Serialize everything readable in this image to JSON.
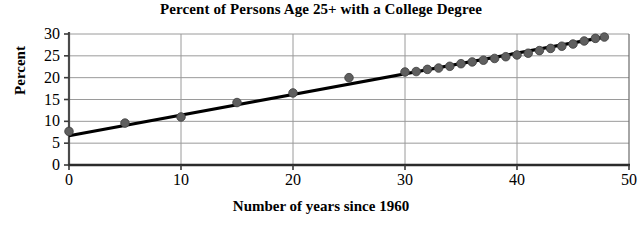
{
  "chart_data": {
    "type": "scatter",
    "title": "Percent of Persons Age 25+ with a College Degree",
    "xlabel": "Number of years since 1960",
    "ylabel": "Percent",
    "xlim": [
      0,
      50
    ],
    "ylim": [
      0,
      30
    ],
    "xticks": [
      0,
      10,
      20,
      30,
      40,
      50
    ],
    "yticks": [
      0,
      5,
      10,
      15,
      20,
      25,
      30
    ],
    "grid": "horizontal-and-vertical",
    "legend": "none",
    "marker_color": "#5f5f5f",
    "line_color": "#000000",
    "series": [
      {
        "name": "Percent with college degree",
        "marker": "circle",
        "points": [
          {
            "x": 0,
            "y": 7.7
          },
          {
            "x": 5,
            "y": 9.6
          },
          {
            "x": 10,
            "y": 11.0
          },
          {
            "x": 15,
            "y": 14.3
          },
          {
            "x": 20,
            "y": 16.5
          },
          {
            "x": 25,
            "y": 20.0
          },
          {
            "x": 30,
            "y": 21.3
          },
          {
            "x": 31,
            "y": 21.4
          },
          {
            "x": 32,
            "y": 21.9
          },
          {
            "x": 33,
            "y": 22.2
          },
          {
            "x": 34,
            "y": 22.6
          },
          {
            "x": 35,
            "y": 23.2
          },
          {
            "x": 36,
            "y": 23.6
          },
          {
            "x": 37,
            "y": 24.0
          },
          {
            "x": 38,
            "y": 24.4
          },
          {
            "x": 39,
            "y": 24.8
          },
          {
            "x": 40,
            "y": 25.2
          },
          {
            "x": 41,
            "y": 25.6
          },
          {
            "x": 42,
            "y": 26.2
          },
          {
            "x": 43,
            "y": 26.7
          },
          {
            "x": 44,
            "y": 27.2
          },
          {
            "x": 45,
            "y": 27.7
          },
          {
            "x": 46,
            "y": 28.4
          },
          {
            "x": 47,
            "y": 29.0
          },
          {
            "x": 47.8,
            "y": 29.3
          }
        ]
      }
    ],
    "trendline": {
      "name": "least-squares regression line",
      "x_start": 0,
      "y_start": 6.7,
      "x_end": 47.8,
      "y_end": 29.3
    }
  }
}
